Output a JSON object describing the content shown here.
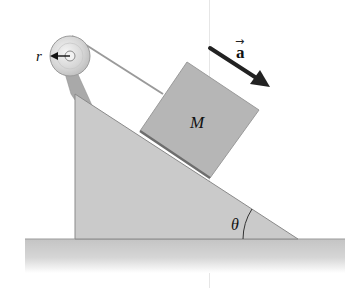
{
  "diagram": {
    "type": "incline-pulley",
    "labels": {
      "radius": "r",
      "mass": "M",
      "acceleration": "a",
      "acceleration_vector_mark": "→",
      "angle": "θ"
    },
    "colors": {
      "wedge_fill": "#c9c9c9",
      "wedge_edge": "#8a8a8a",
      "block_fill": "#b5b5b5",
      "block_edge": "#7a7a7a",
      "ground_top": "#c2c2c2",
      "ground_bottom": "#ffffff",
      "pulley_fill": "#d9d9d9",
      "rope": "#9a9a9a",
      "arrow": "#222222"
    }
  }
}
